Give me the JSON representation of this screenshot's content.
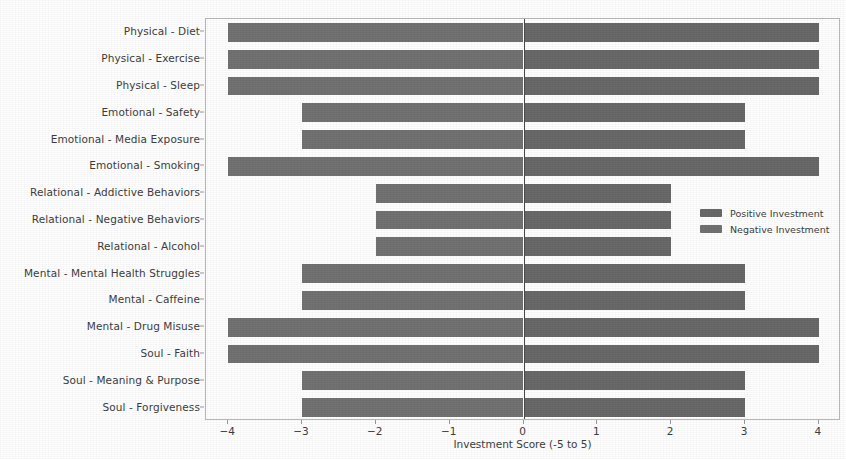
{
  "chart_data": {
    "type": "bar",
    "orientation": "horizontal",
    "title": "",
    "xlabel": "Investment Score (-5 to 5)",
    "ylabel": "",
    "xlim": [
      -4.3,
      4.3
    ],
    "xticks": [
      -4,
      -3,
      -2,
      -1,
      0,
      1,
      2,
      3,
      4
    ],
    "xtick_labels": [
      "−4",
      "−3",
      "−2",
      "−1",
      "0",
      "1",
      "2",
      "3",
      "4"
    ],
    "grid": false,
    "zero_line": true,
    "legend_position": "center-right",
    "categories": [
      "Physical - Diet",
      "Physical - Exercise",
      "Physical - Sleep",
      "Emotional - Safety",
      "Emotional - Media Exposure",
      "Emotional - Smoking",
      "Relational - Addictive Behaviors",
      "Relational - Negative Behaviors",
      "Relational - Alcohol",
      "Mental - Mental Health Struggles",
      "Mental - Caffeine",
      "Mental - Drug Misuse",
      "Soul - Faith",
      "Soul - Meaning & Purpose",
      "Soul - Forgiveness"
    ],
    "series": [
      {
        "name": "Positive Investment",
        "color": "#696969",
        "values": [
          4,
          4,
          4,
          3,
          3,
          4,
          2,
          2,
          2,
          3,
          3,
          4,
          4,
          3,
          3
        ]
      },
      {
        "name": "Negative Investment",
        "color": "#727272",
        "values": [
          -4,
          -4,
          -4,
          -3,
          -3,
          -4,
          -2,
          -2,
          -2,
          -3,
          -3,
          -4,
          -4,
          -3,
          -3
        ]
      }
    ]
  },
  "legend": {
    "entries": [
      {
        "label": "Positive Investment",
        "color": "#696969"
      },
      {
        "label": "Negative Investment",
        "color": "#727272"
      }
    ]
  },
  "axis": {
    "x_label": "Investment Score (-5 to 5)"
  }
}
